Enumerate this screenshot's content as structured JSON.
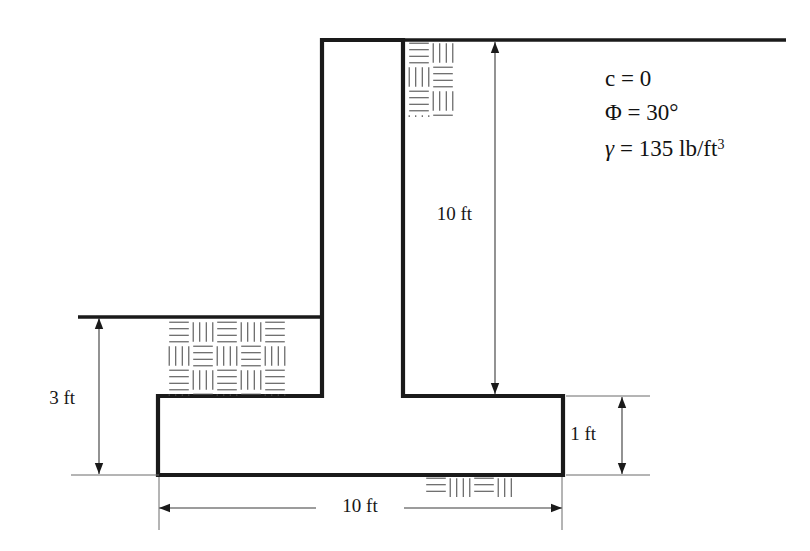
{
  "figure": {
    "background_color": "#ffffff",
    "line_color": "#1a1a1a",
    "dimension_color": "#3a3a3a",
    "hatch_color": "#4a4a4a"
  },
  "soil_properties": {
    "cohesion": "c = 0",
    "friction_angle": "Φ = 30°",
    "unit_weight_symbol": "γ",
    "unit_weight_value": "= 135 lb/ft",
    "unit_weight_exponent": "3"
  },
  "dimensions": {
    "stem_height": "10 ft",
    "footing_depth": "3 ft",
    "base_thickness": "1 ft",
    "base_width": "10 ft"
  },
  "geometry": {
    "stem_left_x": 322,
    "stem_right_x": 403,
    "stem_top_y": 40,
    "slab_left_x": 158,
    "slab_right_x": 563,
    "slab_top_y": 396,
    "slab_bottom_y": 475,
    "ground_left_x": 78,
    "ground_left_y": 317,
    "ground_right_x": 786,
    "ground_top_y": 40,
    "wall_stroke_width": 4.2,
    "ground_stroke_width": 3.4
  },
  "hatch_blocks": [
    {
      "name": "backfill-hatch-top",
      "x": 407,
      "y": 41,
      "width": 49,
      "height": 76,
      "cell": 24
    },
    {
      "name": "backfill-hatch-left",
      "x": 167,
      "y": 320,
      "width": 120,
      "height": 76,
      "cell": 24
    },
    {
      "name": "foundation-hatch-bottom",
      "x": 424,
      "y": 476,
      "width": 93,
      "height": 21,
      "cell": 24
    }
  ],
  "dimension_lines": {
    "stem_height": {
      "x": 495,
      "y1": 42,
      "y2": 394,
      "label_y": 216,
      "label_dx": -23
    },
    "footing_depth": {
      "x": 99,
      "y1": 318,
      "y2": 474,
      "label_y": 400,
      "label_dx": -24
    },
    "base_thickness": {
      "x": 622,
      "y1": 397,
      "y2": 474,
      "label_y": 436,
      "label_dx": -26
    },
    "base_width": {
      "y": 508,
      "x1": 159,
      "x2": 562,
      "label_x": 360,
      "gap_half": 44
    }
  },
  "property_block": {
    "x": 605,
    "line1_y": 86,
    "line2_y": 120,
    "line3_y": 156
  }
}
